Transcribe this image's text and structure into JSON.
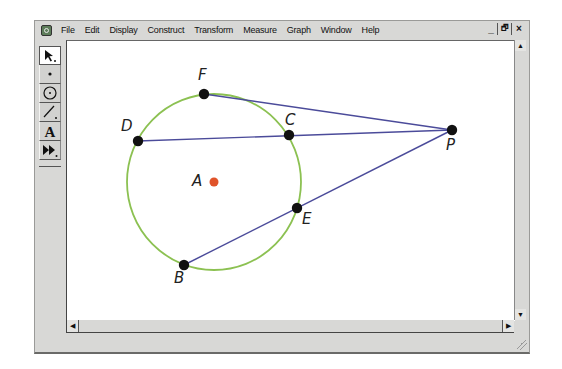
{
  "menubar": {
    "items": [
      "File",
      "Edit",
      "Display",
      "Construct",
      "Transform",
      "Measure",
      "Graph",
      "Window",
      "Help"
    ],
    "window_controls": [
      "_",
      "🗗",
      "×"
    ]
  },
  "toolbox": {
    "tools": [
      {
        "name": "selection-arrow-tool",
        "glyph": "↖"
      },
      {
        "name": "point-tool",
        "glyph": "•"
      },
      {
        "name": "compass-tool",
        "glyph": "⊙"
      },
      {
        "name": "straightedge-tool",
        "glyph": "/"
      },
      {
        "name": "text-tool",
        "glyph": "A"
      },
      {
        "name": "custom-tool",
        "glyph": "⏩"
      }
    ]
  },
  "scrollbars": {
    "up": "▲",
    "down": "▼",
    "left": "◀",
    "right": "▶"
  },
  "drawing": {
    "colors": {
      "circle": "#8cc152",
      "segment": "#4b4b9a",
      "point": "#111111",
      "center": "#e0532a"
    },
    "circle": {
      "center": "A",
      "cx": 214,
      "cy": 182,
      "r": 87
    },
    "points": [
      {
        "label": "F",
        "x": 204,
        "y": 94
      },
      {
        "label": "D",
        "x": 138,
        "y": 141
      },
      {
        "label": "C",
        "x": 289,
        "y": 135
      },
      {
        "label": "P",
        "x": 452,
        "y": 130
      },
      {
        "label": "A",
        "x": 214,
        "y": 182
      },
      {
        "label": "E",
        "x": 297,
        "y": 208
      },
      {
        "label": "B",
        "x": 184,
        "y": 265
      }
    ],
    "segments": [
      [
        "F",
        "P"
      ],
      [
        "D",
        "P"
      ],
      [
        "B",
        "P"
      ]
    ]
  }
}
